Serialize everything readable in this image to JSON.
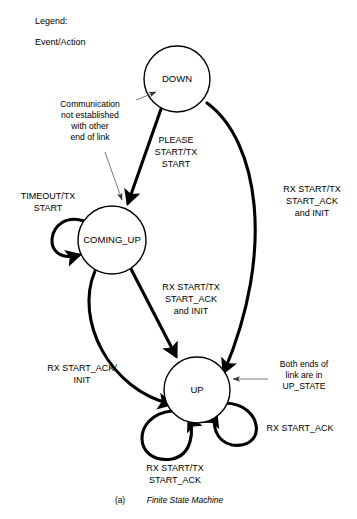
{
  "legend": {
    "title": "Legend:",
    "format": "Event/Action"
  },
  "caption": {
    "index": "(a)",
    "text": "Finite State Machine"
  },
  "states": [
    {
      "id": "down",
      "label": "DOWN",
      "cx": 177,
      "cy": 79,
      "r": 33
    },
    {
      "id": "coming_up",
      "label": "COMING_UP",
      "cx": 112,
      "cy": 240,
      "r": 34
    },
    {
      "id": "up",
      "label": "UP",
      "cx": 197,
      "cy": 390,
      "r": 33
    }
  ],
  "transitions": [
    {
      "id": "down-to-coming-up",
      "from": "down",
      "to": "coming_up",
      "label_lines": [
        "PLEASE",
        "START/TX",
        "START"
      ],
      "label_x": 176,
      "label_y": 143
    },
    {
      "id": "down-to-up",
      "from": "down",
      "to": "up",
      "label_lines": [
        "RX START/TX",
        "START_ACK",
        "and INIT"
      ],
      "label_x": 312,
      "label_y": 192
    },
    {
      "id": "coming-up-to-up",
      "from": "coming_up",
      "to": "up",
      "label_lines": [
        "RX START/TX",
        "START_ACK",
        "and INIT"
      ],
      "label_x": 191,
      "label_y": 290
    },
    {
      "id": "coming-up-to-up-alt",
      "from": "coming_up",
      "to": "up",
      "label_lines": [
        "RX START_ACK/",
        "INIT"
      ],
      "label_x": 82,
      "label_y": 371
    },
    {
      "id": "coming-up-self-loop",
      "from": "coming_up",
      "to": "coming_up",
      "label_lines": [
        "TIMEOUT/TX",
        "START"
      ],
      "label_x": 48,
      "label_y": 199
    },
    {
      "id": "up-self-loop-bottom",
      "from": "up",
      "to": "up",
      "label_lines": [
        "RX START/TX",
        "START_ACK"
      ],
      "label_x": 175,
      "label_y": 471
    },
    {
      "id": "up-self-loop-right",
      "from": "up",
      "to": "up",
      "label_lines": [
        "RX START_ACK"
      ],
      "label_x": 300,
      "label_y": 431
    }
  ],
  "annotations": [
    {
      "id": "communication-not-established",
      "lines": [
        "Communication",
        "not established",
        "with other",
        "end of link"
      ],
      "x": 90,
      "y": 107
    },
    {
      "id": "both-ends-up-state",
      "lines": [
        "Both ends of",
        "link are in",
        "UP_STATE"
      ],
      "x": 304,
      "y": 367
    }
  ]
}
